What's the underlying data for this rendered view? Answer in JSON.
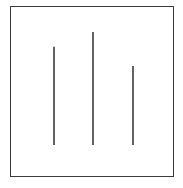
{
  "figure": {
    "lines": [
      {
        "id": "left",
        "relative_length": 0.87
      },
      {
        "id": "middle",
        "relative_length": 1.0
      },
      {
        "id": "right",
        "relative_length": 0.7
      }
    ],
    "line_color": "#3a3a3a",
    "frame_color": "#3a3a3a"
  },
  "caption": ""
}
